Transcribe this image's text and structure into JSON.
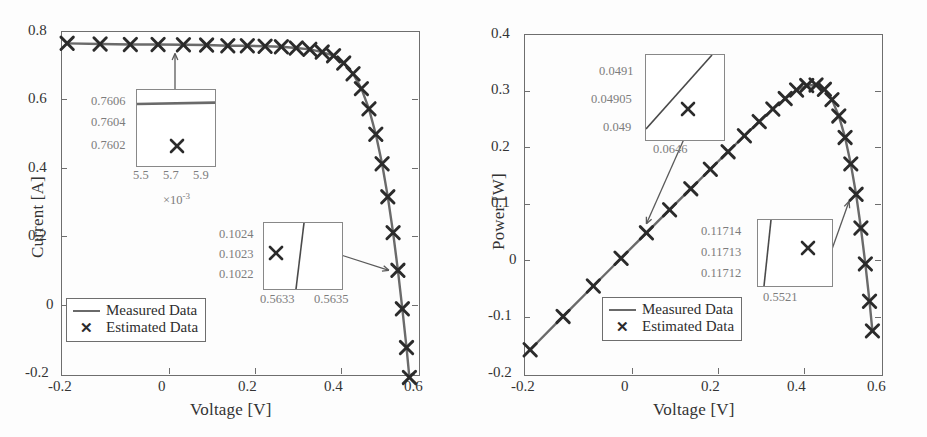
{
  "chart_data": [
    {
      "type": "line",
      "id": "iv-curve",
      "title": "",
      "xlabel": "Voltage [V]",
      "ylabel": "Current [A]",
      "xlim": [
        -0.22,
        0.61
      ],
      "ylim": [
        -0.2,
        0.8
      ],
      "xticks": [
        "-0.2",
        "0",
        "0.2",
        "0.4",
        "0.6"
      ],
      "xtick_values": [
        -0.2,
        0,
        0.2,
        0.4,
        0.6
      ],
      "yticks": [
        "0.8",
        "0.6",
        "0.4",
        "0.2",
        "0",
        "-0.2"
      ],
      "ytick_values": [
        0.8,
        0.6,
        0.4,
        0.2,
        0,
        -0.2
      ],
      "grid": false,
      "legend_position": "lower-left",
      "series": [
        {
          "name": "Measured Data",
          "style": "line",
          "color": "#6a6a6a",
          "x": [
            -0.2057,
            -0.1291,
            -0.0588,
            0.0057,
            0.0646,
            0.1185,
            0.1678,
            0.2132,
            0.2545,
            0.2924,
            0.3269,
            0.3585,
            0.3873,
            0.4137,
            0.4373,
            0.459,
            0.4784,
            0.496,
            0.5119,
            0.5265,
            0.5398,
            0.5521,
            0.5633,
            0.5736,
            0.5833,
            0.59,
            0.5959,
            0.6
          ],
          "y": [
            0.764,
            0.762,
            0.7605,
            0.7605,
            0.76,
            0.759,
            0.757,
            0.757,
            0.7555,
            0.754,
            0.7505,
            0.7465,
            0.7385,
            0.728,
            0.7065,
            0.6755,
            0.632,
            0.573,
            0.499,
            0.413,
            0.3165,
            0.2122,
            0.1023,
            -0.01,
            -0.123,
            -0.21,
            -0.2,
            -0.2
          ]
        },
        {
          "name": "Estimated Data",
          "style": "marker-x",
          "color": "#2b2b2b",
          "x": [
            -0.2057,
            -0.1291,
            -0.0588,
            0.0057,
            0.0646,
            0.1185,
            0.1678,
            0.2132,
            0.2545,
            0.2924,
            0.3269,
            0.3585,
            0.3873,
            0.4137,
            0.4373,
            0.459,
            0.4784,
            0.496,
            0.5119,
            0.5265,
            0.5398,
            0.5521,
            0.5633,
            0.5736,
            0.5833,
            0.59
          ],
          "y": [
            0.764,
            0.762,
            0.7605,
            0.7605,
            0.76,
            0.759,
            0.757,
            0.757,
            0.7555,
            0.754,
            0.7505,
            0.7465,
            0.7385,
            0.728,
            0.7065,
            0.6755,
            0.632,
            0.573,
            0.499,
            0.413,
            0.3165,
            0.2122,
            0.1023,
            -0.01,
            -0.123,
            -0.21
          ]
        }
      ],
      "insets": [
        {
          "id": "iv-inset-isc",
          "yticks": [
            "0.7606",
            "0.7604",
            "0.7602"
          ],
          "xticks": [
            "5.5",
            "5.7",
            "5.9"
          ],
          "exponent": "×10",
          "exponent_sup": "-3",
          "callout_from": "data point near V = 0.0057 V"
        },
        {
          "id": "iv-inset-knee",
          "yticks": [
            "0.1024",
            "0.1023",
            "0.1022"
          ],
          "xticks": [
            "0.5633",
            "0.5635"
          ],
          "exponent": "",
          "exponent_sup": "",
          "callout_from": "data point near V = 0.5633 V"
        }
      ],
      "legend": [
        {
          "label": "Measured Data",
          "marker": "line"
        },
        {
          "label": "Estimated Data",
          "marker": "✕"
        }
      ]
    },
    {
      "type": "line",
      "id": "pv-curve",
      "title": "",
      "xlabel": "Voltage [V]",
      "ylabel": "Power [W]",
      "xlim": [
        -0.22,
        0.61
      ],
      "ylim": [
        -0.2,
        0.4
      ],
      "xticks": [
        "-0.2",
        "0",
        "0.2",
        "0.4",
        "0.6"
      ],
      "xtick_values": [
        -0.2,
        0,
        0.2,
        0.4,
        0.6
      ],
      "yticks": [
        "0.4",
        "0.3",
        "0.2",
        "0.1",
        "0",
        "-0.1",
        "-0.2"
      ],
      "ytick_values": [
        0.4,
        0.3,
        0.2,
        0.1,
        0,
        -0.1,
        -0.2
      ],
      "grid": false,
      "legend_position": "lower-center",
      "series": [
        {
          "name": "Measured Data",
          "style": "line",
          "color": "#6a6a6a",
          "x": [
            -0.2057,
            -0.1291,
            -0.0588,
            0.0057,
            0.0646,
            0.1185,
            0.1678,
            0.2132,
            0.2545,
            0.2924,
            0.3269,
            0.3585,
            0.3873,
            0.4137,
            0.4373,
            0.459,
            0.4784,
            0.496,
            0.5119,
            0.5265,
            0.5398,
            0.5521,
            0.5633,
            0.5736,
            0.5833,
            0.59
          ],
          "y": [
            -0.1572,
            -0.0984,
            -0.0447,
            0.0043,
            0.0491,
            0.0899,
            0.127,
            0.1613,
            0.1923,
            0.2204,
            0.2454,
            0.2676,
            0.286,
            0.3011,
            0.309,
            0.3101,
            0.3024,
            0.2842,
            0.2554,
            0.2175,
            0.1708,
            0.1171,
            0.0576,
            -0.0057,
            -0.0717,
            -0.1239
          ]
        },
        {
          "name": "Estimated Data",
          "style": "marker-x",
          "color": "#2b2b2b",
          "x": [
            -0.2057,
            -0.1291,
            -0.0588,
            0.0057,
            0.0646,
            0.1185,
            0.1678,
            0.2132,
            0.2545,
            0.2924,
            0.3269,
            0.3585,
            0.3873,
            0.4137,
            0.4373,
            0.459,
            0.4784,
            0.496,
            0.5119,
            0.5265,
            0.5398,
            0.5521,
            0.5633,
            0.5736,
            0.5833,
            0.59
          ],
          "y": [
            -0.1572,
            -0.0984,
            -0.0447,
            0.0043,
            0.0491,
            0.0899,
            0.127,
            0.1613,
            0.1923,
            0.2204,
            0.2454,
            0.2676,
            0.286,
            0.3011,
            0.309,
            0.3101,
            0.3024,
            0.2842,
            0.2554,
            0.2175,
            0.1708,
            0.1171,
            0.0576,
            -0.0057,
            -0.0717,
            -0.1239
          ]
        }
      ],
      "insets": [
        {
          "id": "pv-inset-low",
          "yticks": [
            "0.0491",
            "0.04905",
            "0.049"
          ],
          "xticks": [
            "0.0646"
          ],
          "exponent": "",
          "exponent_sup": "",
          "callout_from": "data point near V = 0.0646 V"
        },
        {
          "id": "pv-inset-knee",
          "yticks": [
            "0.11714",
            "0.11713",
            "0.11712"
          ],
          "xticks": [
            "0.5521"
          ],
          "exponent": "",
          "exponent_sup": "",
          "callout_from": "data point near V = 0.5521 V"
        }
      ],
      "legend": [
        {
          "label": "Measured Data",
          "marker": "line"
        },
        {
          "label": "Estimated Data",
          "marker": "✕"
        }
      ]
    }
  ],
  "colors": {
    "measured_line": "#6a6a6a",
    "estimated_marker": "#2b2b2b",
    "axis": "#6e6e6e",
    "inset_text": "#7c7c7c",
    "label_text": "#333333"
  }
}
